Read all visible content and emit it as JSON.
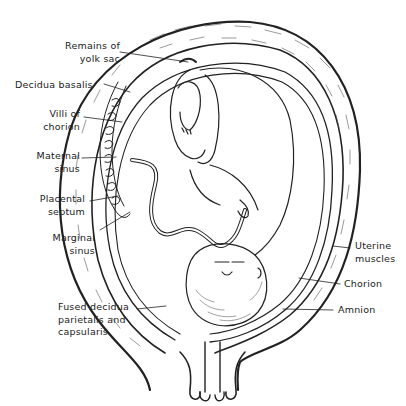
{
  "figure": {
    "colors": {
      "ink": "#222222",
      "background": "#ffffff"
    }
  },
  "labels": {
    "remains_of_yolk_sac": "Remains of\nyolk sac",
    "decidua_basalis": "Decidua basalis",
    "villi_of_chorion": "Villi of\nchorion",
    "maternal_sinus": "Maternal\nsinus",
    "placental_septum": "Placental\nseptum",
    "marginal_sinus": "Marginal\nsinus",
    "fused_decidua": "Fused decidua\nparietalis and\ncapsularis",
    "uterine_muscles": "Uterine\nmuscles",
    "chorion": "Chorion",
    "amnion": "Amnion"
  }
}
